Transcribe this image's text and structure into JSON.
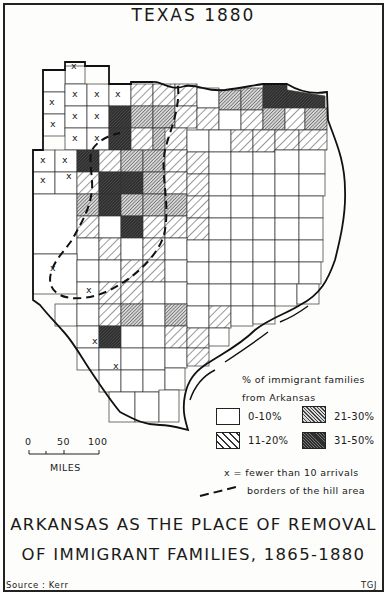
{
  "map": {
    "title": "TEXAS 1880",
    "main_title_line1": "ARKANSAS AS THE PLACE OF REMOVAL",
    "main_title_line2": "OF IMMIGRANT FAMILIES, 1865-1880",
    "source": "Source : Kerr",
    "author": "TGJ"
  },
  "legend": {
    "title_line1": "% of immigrant families",
    "title_line2": "from Arkansas",
    "classes": [
      {
        "label": "0-10%",
        "pattern": "none",
        "color": "#ffffff"
      },
      {
        "label": "11-20%",
        "pattern": "light-diagonal",
        "color": "#bdbdbd"
      },
      {
        "label": "21-30%",
        "pattern": "dense-diagonal",
        "color": "#8a8a8a"
      },
      {
        "label": "31-50%",
        "pattern": "dark-crosshatch",
        "color": "#3a3a3a"
      }
    ],
    "x_note": "x = fewer than 10 arrivals",
    "border_note": "borders of the hill area"
  },
  "scale_bar": {
    "ticks": [
      "0",
      "50",
      "100"
    ],
    "unit": "MILES"
  },
  "x_marker": "x"
}
